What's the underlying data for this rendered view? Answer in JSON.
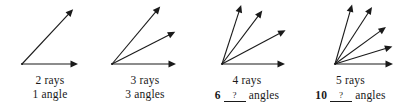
{
  "figure": {
    "stroke_color": "#1a1a1a",
    "background_color": "#ffffff"
  },
  "panels": [
    {
      "id": "panel-2-rays",
      "ray_count": 2,
      "angle_count": 1,
      "line1": "2 rays",
      "line2_prefix": "",
      "line2_blank": "",
      "line2_text": "1 angle",
      "has_blank": false,
      "vertex": {
        "x": 22,
        "y": 64
      },
      "rays": [
        {
          "angle_deg": 0,
          "length": 56
        },
        {
          "angle_deg": 47,
          "length": 75
        }
      ]
    },
    {
      "id": "panel-3-rays",
      "ray_count": 3,
      "angle_count": 3,
      "line1": "3 rays",
      "line2_prefix": "",
      "line2_blank": "",
      "line2_text": "3 angles",
      "has_blank": false,
      "vertex": {
        "x": 112,
        "y": 64
      },
      "rays": [
        {
          "angle_deg": 0,
          "length": 64
        },
        {
          "angle_deg": 27,
          "length": 71
        },
        {
          "angle_deg": 50,
          "length": 75
        }
      ]
    },
    {
      "id": "panel-4-rays",
      "ray_count": 4,
      "angle_count": 6,
      "line1": "4 rays",
      "line2_prefix": "6",
      "line2_blank": "?",
      "line2_text": "angles",
      "has_blank": true,
      "vertex": {
        "x": 222,
        "y": 64
      },
      "rays": [
        {
          "angle_deg": 0,
          "length": 63
        },
        {
          "angle_deg": 28,
          "length": 72
        },
        {
          "angle_deg": 53,
          "length": 67
        },
        {
          "angle_deg": 72,
          "length": 62
        }
      ]
    },
    {
      "id": "panel-5-rays",
      "ray_count": 5,
      "angle_count": 10,
      "line1": "5 rays",
      "line2_prefix": "10",
      "line2_blank": "?",
      "line2_text": "angles",
      "has_blank": true,
      "vertex": {
        "x": 335,
        "y": 64
      },
      "rays": [
        {
          "angle_deg": 0,
          "length": 58
        },
        {
          "angle_deg": 17,
          "length": 60
        },
        {
          "angle_deg": 36,
          "length": 63
        },
        {
          "angle_deg": 57,
          "length": 68
        },
        {
          "angle_deg": 74,
          "length": 62
        }
      ]
    }
  ]
}
